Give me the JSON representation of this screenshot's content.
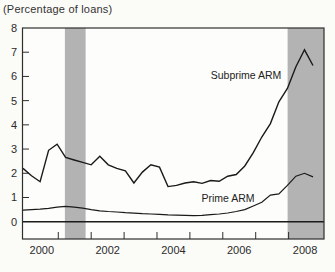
{
  "title": "(Percentage of loans)",
  "colors": {
    "background": "#fbfbf8",
    "plot_fill": "#fdfdfb",
    "recession_band": "#b3b3b3",
    "line": "#1a1a1a",
    "frame": "#2e2e2e",
    "text": "#2b2b2b"
  },
  "chart_data": {
    "type": "line",
    "title": "(Percentage of loans)",
    "xlabel": "",
    "ylabel": "Percentage of loans",
    "ylim": [
      0,
      8
    ],
    "yticks": [
      0,
      1,
      2,
      3,
      4,
      5,
      6,
      7,
      8
    ],
    "grid": false,
    "legend_position": "inline-annotations",
    "x_quarters": [
      "2000Q1",
      "2000Q2",
      "2000Q3",
      "2000Q4",
      "2001Q1",
      "2001Q2",
      "2001Q3",
      "2001Q4",
      "2002Q1",
      "2002Q2",
      "2002Q3",
      "2002Q4",
      "2003Q1",
      "2003Q2",
      "2003Q3",
      "2003Q4",
      "2004Q1",
      "2004Q2",
      "2004Q3",
      "2004Q4",
      "2005Q1",
      "2005Q2",
      "2005Q3",
      "2005Q4",
      "2006Q1",
      "2006Q2",
      "2006Q3",
      "2006Q4",
      "2007Q1",
      "2007Q2",
      "2007Q3",
      "2007Q4",
      "2008Q1",
      "2008Q2",
      "2008Q3"
    ],
    "series": [
      {
        "name": "Subprime ARM",
        "values": [
          2.2,
          1.9,
          1.65,
          2.95,
          3.2,
          2.65,
          2.55,
          2.45,
          2.35,
          2.7,
          2.35,
          2.2,
          2.1,
          1.6,
          2.05,
          2.35,
          2.25,
          1.45,
          1.5,
          1.6,
          1.65,
          1.58,
          1.7,
          1.67,
          1.88,
          1.95,
          2.3,
          2.85,
          3.5,
          4.05,
          4.95,
          5.5,
          6.4,
          7.1,
          6.45
        ]
      },
      {
        "name": "Prime ARM",
        "values": [
          0.48,
          0.5,
          0.52,
          0.55,
          0.6,
          0.63,
          0.6,
          0.56,
          0.5,
          0.45,
          0.42,
          0.4,
          0.37,
          0.35,
          0.33,
          0.32,
          0.3,
          0.28,
          0.27,
          0.26,
          0.25,
          0.26,
          0.29,
          0.32,
          0.36,
          0.42,
          0.5,
          0.65,
          0.8,
          1.1,
          1.15,
          1.5,
          1.88,
          2.0,
          1.85
        ]
      }
    ],
    "xtick_boundary_years": [
      2001,
      2002,
      2003,
      2004,
      2005,
      2006,
      2007,
      2008
    ],
    "xtick_labels": [
      "2000",
      "2002",
      "2004",
      "2006",
      "2008"
    ],
    "xtick_label_years": [
      2000,
      2002,
      2004,
      2006,
      2008
    ],
    "recession_bands": [
      {
        "start": 2001.2,
        "end": 2001.83
      },
      {
        "start": 2007.97,
        "end": 2009.08
      }
    ]
  }
}
